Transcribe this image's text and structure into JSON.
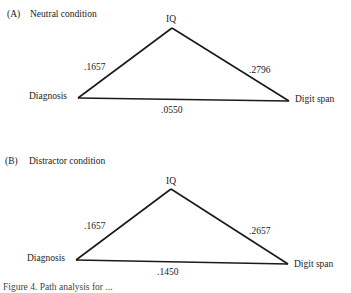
{
  "panels": [
    {
      "label": "(A)",
      "title": "Neutral condition",
      "nodes": {
        "top": "IQ",
        "left": "Diagnosis",
        "right": "Digit span"
      },
      "paths": {
        "diagnosis_iq": ".1657",
        "iq_digitspan": ".2796",
        "diagnosis_digitspan": ".0550"
      }
    },
    {
      "label": "(B)",
      "title": "Distractor condition",
      "nodes": {
        "top": "IQ",
        "left": "Diagnosis",
        "right": "Digit span"
      },
      "paths": {
        "diagnosis_iq": ".1657",
        "iq_digitspan": ".2657",
        "diagnosis_digitspan": ".1450"
      }
    }
  ],
  "caption": "Figure 4. Path analysis for ..."
}
